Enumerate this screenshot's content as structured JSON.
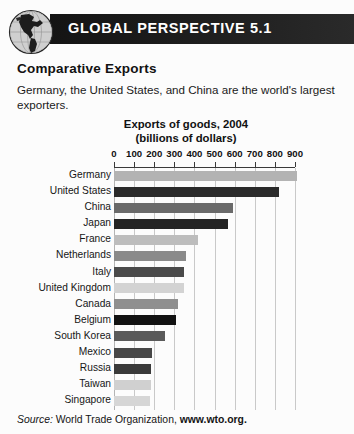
{
  "banner": {
    "title": "GLOBAL PERSPECTIVE 5.1",
    "icon": "globe-icon",
    "bar_color": "#1c1c1c",
    "text_color": "#ffffff"
  },
  "article": {
    "heading": "Comparative Exports",
    "body": "Germany, the United States, and China are the world's largest exporters."
  },
  "source": {
    "prefix": "Source:",
    "organization": "World Trade Organization,",
    "url": "www.wto.org."
  },
  "chart_data": {
    "type": "bar",
    "orientation": "horizontal",
    "title": "Exports of goods, 2004",
    "subtitle": "(billions of dollars)",
    "xlabel": "",
    "ylabel": "",
    "xlim": [
      0,
      900
    ],
    "xticks": [
      0,
      100,
      200,
      300,
      400,
      500,
      600,
      700,
      800,
      900
    ],
    "grid": true,
    "legend": "none",
    "categories": [
      "Germany",
      "United States",
      "China",
      "Japan",
      "France",
      "Netherlands",
      "Italy",
      "United Kingdom",
      "Canada",
      "Belgium",
      "South Korea",
      "Mexico",
      "Russia",
      "Taiwan",
      "Singapore"
    ],
    "values": [
      912,
      819,
      593,
      566,
      419,
      358,
      346,
      346,
      317,
      307,
      254,
      189,
      183,
      182,
      180
    ],
    "bar_colors": [
      "#b3b3b3",
      "#2b2b2b",
      "#6a6a6a",
      "#242424",
      "#bdbdbd",
      "#8a8a8a",
      "#4a4a4a",
      "#d3d3d3",
      "#8f8f8f",
      "#121212",
      "#5a5a5a",
      "#474747",
      "#3a3a3a",
      "#d0d0d0",
      "#d6d6d6"
    ]
  }
}
